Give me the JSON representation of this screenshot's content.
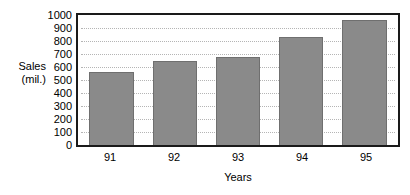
{
  "chart_data": {
    "type": "bar",
    "title": "",
    "categories": [
      "91",
      "92",
      "93",
      "94",
      "95"
    ],
    "values": [
      560,
      650,
      680,
      830,
      960
    ],
    "xlabel": "Years",
    "ylabel": "Sales (mil.)",
    "ylabel_lines": [
      "Sales",
      "(mil.)"
    ],
    "ylim": [
      0,
      1000
    ],
    "ytick_step": 100,
    "yticks": [
      0,
      100,
      200,
      300,
      400,
      500,
      600,
      700,
      800,
      900,
      1000
    ],
    "ytick_labels": [
      "0",
      "100",
      "200",
      "300",
      "400",
      "500",
      "600",
      "700",
      "800",
      "900",
      "1000"
    ],
    "grid": {
      "horizontal": true,
      "vertical": false,
      "style": "dotted"
    },
    "legend": {
      "visible": false,
      "position": "none"
    },
    "colors": {
      "bar_fill": "#8a8a8a",
      "bar_border": "#6f6f6f",
      "plot_border": "#1a1a1a",
      "gridline": "#b5b5b5",
      "background": "#ffffff",
      "text": "#000000"
    }
  }
}
